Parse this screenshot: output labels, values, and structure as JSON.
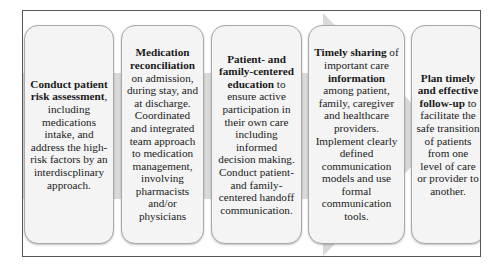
{
  "diagram": {
    "type": "process-arrow",
    "colors": {
      "frame_border": "#555555",
      "arrow_fill": "#d9d9d9",
      "box_fill": "#f4f4f4",
      "box_border": "#a8a8a8",
      "text": "#1a1a1a"
    },
    "steps": [
      {
        "bold_1": "Conduct patient risk assessment",
        "text_1": ", including medications intake, and address the high-risk factors by an interdiscplinary approach."
      },
      {
        "bold_1": "Medication reconciliation",
        "text_1": " on admission, during stay, and at discharge. Coordinated and integrated team approach to medication management, involving pharmacists and/or physicians"
      },
      {
        "bold_1": "Patient- and family-centered education",
        "text_1": " to ensure active participation in their own care including informed decision making. Conduct patient- and family-centered handoff communication."
      },
      {
        "bold_1": "Timely sharing",
        "text_1": " of important care ",
        "bold_2": "information",
        "text_2": " among patient, family, caregiver and healthcare providers. Implement clearly defined communication models and use formal communication tools."
      },
      {
        "bold_1": "Plan timely and effective follow-up",
        "text_1": " to facilitate the safe transition of patients from one level of care or provider to another."
      }
    ]
  }
}
